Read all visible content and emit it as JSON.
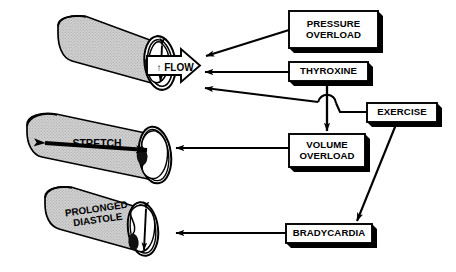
{
  "diagram": {
    "background_color": "#ffffff",
    "line_color": "#000000",
    "cylinder_fill": "#c9c9c9",
    "cylinder_lumen_fill": "#ffffff"
  },
  "boxes": [
    {
      "id": "pressure-overload",
      "label": "PRESSURE\nOVERLOAD",
      "x": 289,
      "y": 11,
      "w": 89,
      "h": 37,
      "font_size": 9.6
    },
    {
      "id": "thyroxine",
      "label": "THYROXINE",
      "x": 289,
      "y": 62,
      "w": 79,
      "h": 19,
      "font_size": 9.6
    },
    {
      "id": "exercise",
      "label": "EXERCISE",
      "x": 367,
      "y": 103,
      "w": 70,
      "h": 19,
      "font_size": 9.6
    },
    {
      "id": "volume-overload",
      "label": "VOLUME\nOVERLOAD",
      "x": 289,
      "y": 134,
      "w": 76,
      "h": 33,
      "font_size": 9.6
    },
    {
      "id": "bradycardia",
      "label": "BRADYCARDIA",
      "x": 286,
      "y": 224,
      "w": 86,
      "h": 19,
      "font_size": 9.6
    }
  ],
  "cylinders": [
    {
      "id": "flow-cylinder",
      "label": "↑ FLOW",
      "description": "thick-walled vessel with narrow lumen and outflow arrow",
      "arrow_type": "vertical-double-arrow-plus-outline-flow-arrow"
    },
    {
      "id": "stretch-cylinder",
      "label": "STRETCH",
      "description": "thin-walled dilated vessel with wide lumen",
      "arrow_type": "horizontal-double-arrow"
    },
    {
      "id": "diastole-cylinder",
      "label": "PROLONGED\nDIASTOLE",
      "description": "vessel with enlarged lumen during prolonged diastole",
      "arrow_type": "vertical-double-arrow"
    }
  ],
  "connections": [
    {
      "from": "pressure-overload",
      "to": "flow-cylinder",
      "style": "diagonal-arrow"
    },
    {
      "from": "thyroxine",
      "to": "flow-cylinder",
      "style": "horizontal-arrow"
    },
    {
      "from": "exercise",
      "to": "flow-cylinder",
      "style": "horizontal-arrow-with-hop"
    },
    {
      "from": "thyroxine",
      "to": "volume-overload",
      "style": "vertical-arrow"
    },
    {
      "from": "volume-overload",
      "to": "stretch-cylinder",
      "style": "horizontal-arrow"
    },
    {
      "from": "exercise",
      "to": "bradycardia",
      "style": "diagonal-arrow"
    },
    {
      "from": "bradycardia",
      "to": "diastole-cylinder",
      "style": "horizontal-arrow"
    }
  ]
}
